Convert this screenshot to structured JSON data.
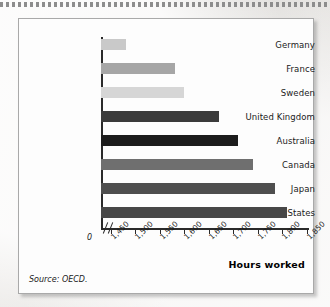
{
  "figure": {
    "source_note": "Source: OECD.",
    "x_axis_title": "Hours worked",
    "zero_label": "0"
  },
  "chart_data": {
    "type": "bar",
    "orientation": "horizontal",
    "title": "",
    "xlabel": "Hours worked",
    "ylabel": "",
    "categories": [
      "Germany",
      "France",
      "Sweden",
      "United Kingdom",
      "Australia",
      "Canada",
      "Japan",
      "United States"
    ],
    "values": [
      1480,
      1580,
      1600,
      1670,
      1710,
      1740,
      1785,
      1810
    ],
    "bar_colors": [
      "#c9c9c9",
      "#a6a6a6",
      "#d6d6d6",
      "#3b3b3b",
      "#1c1c1c",
      "#6f6f6f",
      "#4e4e4e",
      "#474747"
    ],
    "xlim": [
      1430,
      1850
    ],
    "axis_break": true,
    "tick_labels": [
      "1,450",
      "1,500",
      "1,550",
      "1,600",
      "1,650",
      "1,700",
      "1,750",
      "1,800",
      "1,850"
    ],
    "tick_values": [
      1450,
      1500,
      1550,
      1600,
      1650,
      1700,
      1750,
      1800,
      1850
    ],
    "grid": false,
    "legend": "none",
    "source": "OECD."
  }
}
